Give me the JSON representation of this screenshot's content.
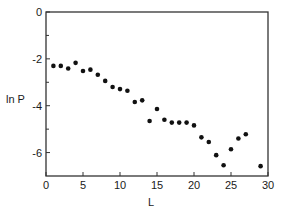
{
  "chart_data": {
    "type": "scatter",
    "title": "",
    "xlabel": "L",
    "ylabel": "ln P",
    "xlim": [
      0,
      30
    ],
    "ylim": [
      -7,
      0
    ],
    "grid": false,
    "legend": null,
    "x_ticks": [
      0,
      5,
      10,
      15,
      20,
      25,
      30
    ],
    "x_tick_labels": [
      "0",
      "5",
      "10",
      "15",
      "20",
      "25",
      "30"
    ],
    "y_ticks": [
      0,
      -2,
      -4,
      -6
    ],
    "y_tick_labels": [
      "0",
      "-2",
      "-4",
      "-6"
    ],
    "y_minor_ticks": [
      -1,
      -3,
      -5
    ],
    "series": [
      {
        "name": "ln P",
        "marker": "filled-circle",
        "color": "#1a1a1a",
        "x": [
          1,
          2,
          3,
          4,
          5,
          6,
          7,
          8,
          9,
          10,
          11,
          12,
          13,
          14,
          15,
          16,
          17,
          18,
          19,
          20,
          21,
          22,
          23,
          24,
          25,
          26,
          27,
          29
        ],
        "y": [
          -2.3,
          -2.3,
          -2.41,
          -2.17,
          -2.52,
          -2.46,
          -2.68,
          -2.94,
          -3.2,
          -3.29,
          -3.36,
          -3.84,
          -3.77,
          -4.65,
          -4.14,
          -4.6,
          -4.72,
          -4.72,
          -4.72,
          -4.84,
          -5.35,
          -5.55,
          -6.11,
          -6.54,
          -5.86,
          -5.4,
          -5.22,
          -6.58
        ]
      }
    ]
  },
  "labels": {
    "xlabel": "L",
    "ylabel": "ln P"
  },
  "style": {
    "axis_color": "#333333",
    "marker_color": "#111111"
  }
}
